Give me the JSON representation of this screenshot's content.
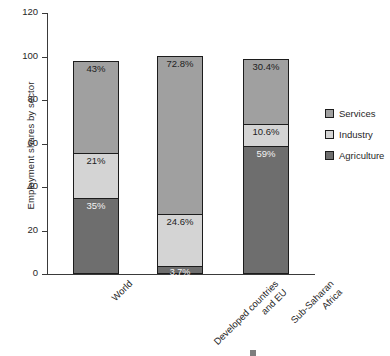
{
  "chart_data": {
    "type": "bar",
    "subtype": "stacked-bar",
    "title": "",
    "xlabel": "",
    "ylabel": "Employment shares by sector",
    "ylim": [
      0,
      120
    ],
    "yticks": [
      0,
      20,
      40,
      60,
      80,
      100,
      120
    ],
    "ytick_labels": [
      "0",
      "20",
      "40",
      "60",
      "80",
      "100",
      "120"
    ],
    "grid": false,
    "legend_position": "right",
    "categories": [
      "World",
      "Developed countries and EU",
      "Sub-Saharan Africa"
    ],
    "category_labels_wrapped": [
      [
        "World"
      ],
      [
        "Developed countries",
        "and EU"
      ],
      [
        "Sub-Saharan",
        "Africa"
      ]
    ],
    "series": [
      {
        "name": "Agriculture",
        "color": "#6e6e6e",
        "values": [
          35,
          3.7,
          59
        ],
        "data_labels": [
          "35%",
          "3.7%",
          "59%"
        ],
        "label_color": "light"
      },
      {
        "name": "Industry",
        "color": "#d4d4d4",
        "values": [
          21,
          24.6,
          10.6
        ],
        "data_labels": [
          "21%",
          "24.6%",
          "10.6%"
        ],
        "label_color": "dark"
      },
      {
        "name": "Services",
        "color": "#a0a0a0",
        "values": [
          43,
          72.8,
          30.4
        ],
        "data_labels": [
          "43%",
          "72.8%",
          "30.4%"
        ],
        "label_color": "dark"
      }
    ],
    "stack_order_bottom_to_top": [
      "Agriculture",
      "Industry",
      "Services"
    ],
    "column_totals": [
      99,
      101.1,
      100
    ]
  },
  "legend": {
    "items": [
      {
        "label": "Services",
        "color": "#a0a0a0"
      },
      {
        "label": "Industry",
        "color": "#d4d4d4"
      },
      {
        "label": "Agriculture",
        "color": "#6e6e6e"
      }
    ]
  },
  "axis": {
    "y_title": "Employment shares by sector"
  },
  "colors": {
    "services": "#a0a0a0",
    "industry": "#d4d4d4",
    "agriculture": "#6e6e6e",
    "axis": "#3a3a3a",
    "outline": "#1c1c1c",
    "text": "#272727",
    "background": "#ffffff"
  }
}
